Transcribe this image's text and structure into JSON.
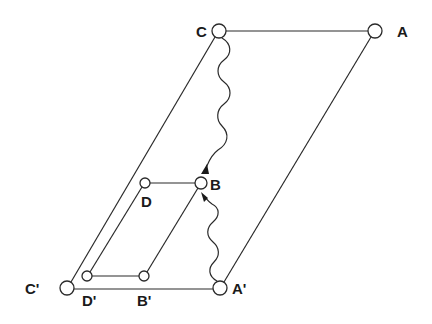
{
  "diagram": {
    "colors": {
      "stroke": "#2a2a2a",
      "text": "#1a1a1a",
      "background": "#ffffff"
    },
    "nodes": {
      "C": {
        "label": "C",
        "x": 219,
        "y": 31,
        "r": 7
      },
      "A": {
        "label": "A",
        "x": 375,
        "y": 31,
        "r": 7
      },
      "C_prime": {
        "label": "C'",
        "x": 67,
        "y": 288,
        "r": 7
      },
      "A_prime": {
        "label": "A'",
        "x": 220,
        "y": 288,
        "r": 7
      },
      "D": {
        "label": "D",
        "x": 145,
        "y": 183,
        "r": 5
      },
      "B": {
        "label": "B",
        "x": 201,
        "y": 183,
        "r": 6
      },
      "D_prime": {
        "label": "D'",
        "x": 87,
        "y": 276,
        "r": 5
      },
      "B_prime": {
        "label": "B'",
        "x": 144,
        "y": 276,
        "r": 5
      }
    },
    "edges": [
      [
        "C",
        "A"
      ],
      [
        "C_prime",
        "C"
      ],
      [
        "A_prime",
        "A"
      ],
      [
        "C_prime",
        "A_prime"
      ],
      [
        "D",
        "B"
      ],
      [
        "D_prime",
        "D"
      ],
      [
        "B_prime",
        "B"
      ],
      [
        "D_prime",
        "B_prime"
      ]
    ],
    "wavy_arrows": [
      {
        "from": "C",
        "to": "B",
        "direction": "down"
      },
      {
        "from": "A_prime",
        "to": "B",
        "direction": "up"
      }
    ]
  }
}
